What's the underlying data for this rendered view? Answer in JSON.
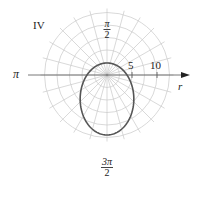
{
  "panel_label": "IV",
  "axis_labels": {
    "top": {
      "num": "π",
      "den": "2"
    },
    "bottom": {
      "num": "3π",
      "den": "2"
    },
    "left": "π",
    "r_axis": "r"
  },
  "tick_labels": [
    "5",
    "10"
  ],
  "colors": {
    "grid": "#c8c8c8",
    "axis": "#333333",
    "curve": "#555555",
    "text": "#222222"
  },
  "chart_data": {
    "type": "polar-line",
    "title": "IV",
    "grid": {
      "radial_rings": [
        2.5,
        5,
        7.5,
        10,
        12.5
      ],
      "spoke_step_deg": 15
    },
    "r_tick_labels": [
      "5",
      "10"
    ],
    "angle_labels": [
      "π/2",
      "π",
      "3π/2"
    ],
    "axis_label": "r",
    "curve": {
      "description": "ellipse with focus at the pole, elongated downward",
      "equation_estimate": "r = 12 / (3 + 2 sin θ)",
      "points": [
        {
          "theta": "0",
          "r": 4
        },
        {
          "theta": "π/2",
          "r": 2.4
        },
        {
          "theta": "π",
          "r": 4
        },
        {
          "theta": "3π/2",
          "r": 12
        }
      ]
    }
  }
}
